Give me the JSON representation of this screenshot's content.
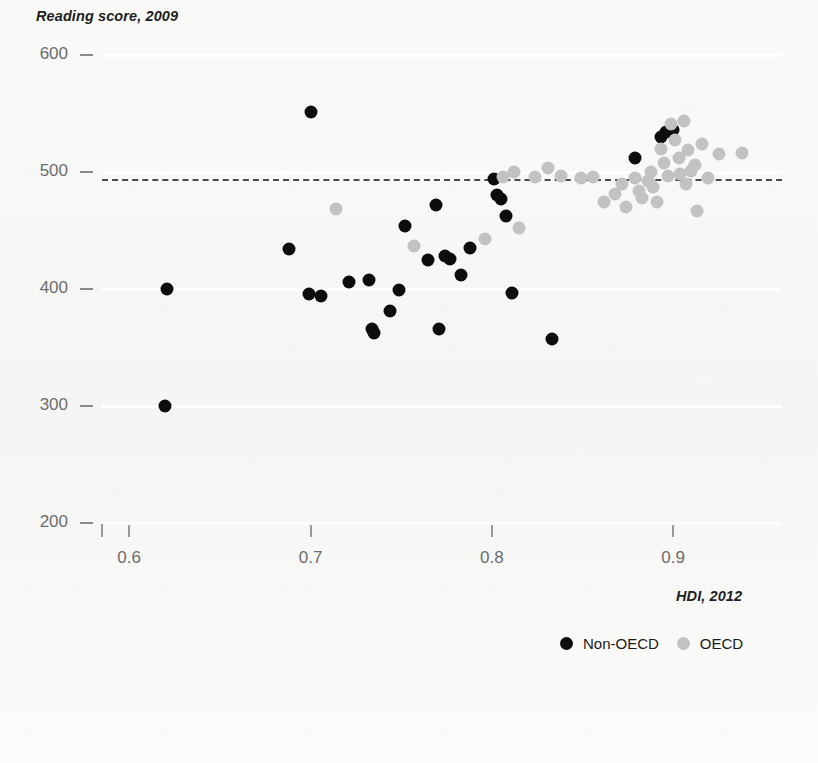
{
  "chart_data": {
    "type": "scatter",
    "title": "",
    "ylabel": "Reading score, 2009",
    "xlabel": "HDI, 2012",
    "xlim": [
      0.585,
      0.96
    ],
    "ylim": [
      200,
      600
    ],
    "xticks": [
      0.6,
      0.7,
      0.8,
      0.9
    ],
    "xtick_labels": [
      "0.6",
      "0.7",
      "0.8",
      "0.9"
    ],
    "yticks": [
      200,
      300,
      400,
      500,
      600
    ],
    "ytick_labels": [
      "200",
      "300",
      "400",
      "500",
      "600"
    ],
    "grid": "horizontal-white",
    "legend_position": "bottom-right",
    "reference_line": {
      "orientation": "horizontal",
      "y": 494,
      "style": "dashed",
      "color": "#4a4a4a"
    },
    "series": [
      {
        "name": "Non-OECD",
        "color": "#0d0d0d",
        "points": [
          [
            0.621,
            400
          ],
          [
            0.62,
            300
          ],
          [
            0.688,
            434
          ],
          [
            0.7,
            551
          ],
          [
            0.699,
            396
          ],
          [
            0.706,
            394
          ],
          [
            0.721,
            406
          ],
          [
            0.732,
            408
          ],
          [
            0.734,
            366
          ],
          [
            0.735,
            362
          ],
          [
            0.744,
            381
          ],
          [
            0.749,
            399
          ],
          [
            0.752,
            454
          ],
          [
            0.765,
            425
          ],
          [
            0.769,
            472
          ],
          [
            0.771,
            366
          ],
          [
            0.774,
            428
          ],
          [
            0.777,
            426
          ],
          [
            0.783,
            412
          ],
          [
            0.788,
            435
          ],
          [
            0.801,
            494
          ],
          [
            0.803,
            480
          ],
          [
            0.805,
            477
          ],
          [
            0.808,
            462
          ],
          [
            0.811,
            397
          ],
          [
            0.833,
            357
          ],
          [
            0.879,
            512
          ],
          [
            0.893,
            530
          ],
          [
            0.896,
            534
          ],
          [
            0.9,
            536
          ]
        ]
      },
      {
        "name": "OECD",
        "color": "#c2c2c2",
        "points": [
          [
            0.714,
            468
          ],
          [
            0.757,
            437
          ],
          [
            0.796,
            443
          ],
          [
            0.806,
            496
          ],
          [
            0.812,
            500
          ],
          [
            0.815,
            452
          ],
          [
            0.824,
            496
          ],
          [
            0.831,
            503
          ],
          [
            0.838,
            497
          ],
          [
            0.849,
            495
          ],
          [
            0.856,
            496
          ],
          [
            0.862,
            474
          ],
          [
            0.868,
            481
          ],
          [
            0.872,
            490
          ],
          [
            0.874,
            470
          ],
          [
            0.879,
            495
          ],
          [
            0.881,
            484
          ],
          [
            0.883,
            478
          ],
          [
            0.886,
            492
          ],
          [
            0.888,
            500
          ],
          [
            0.889,
            487
          ],
          [
            0.891,
            474
          ],
          [
            0.893,
            520
          ],
          [
            0.895,
            508
          ],
          [
            0.897,
            497
          ],
          [
            0.899,
            541
          ],
          [
            0.901,
            527
          ],
          [
            0.903,
            512
          ],
          [
            0.904,
            498
          ],
          [
            0.906,
            544
          ],
          [
            0.907,
            490
          ],
          [
            0.908,
            519
          ],
          [
            0.91,
            501
          ],
          [
            0.912,
            506
          ],
          [
            0.913,
            467
          ],
          [
            0.916,
            524
          ],
          [
            0.919,
            495
          ],
          [
            0.925,
            515
          ],
          [
            0.938,
            516
          ]
        ]
      }
    ]
  },
  "legend": {
    "items": [
      {
        "label": "Non-OECD",
        "color": "#0d0d0d"
      },
      {
        "label": "OECD",
        "color": "#c2c2c2"
      }
    ]
  }
}
